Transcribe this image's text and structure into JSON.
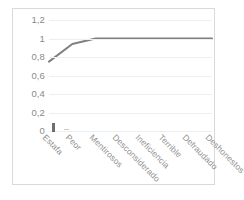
{
  "chart_data": {
    "type": "line",
    "title": "",
    "subtitle": "",
    "xlabel": "",
    "ylabel": "",
    "categories": [
      "Estafa",
      "Peor",
      "Mentirosos",
      "Desconsiderado",
      "Ineficiencia",
      "Terrible",
      "Defraudado",
      "Deshonestos"
    ],
    "values": [
      0.75,
      0.94,
      1,
      1,
      1,
      1,
      1,
      1
    ],
    "series": [
      {
        "name": "",
        "values": [
          0.75,
          0.94,
          1,
          1,
          1,
          1,
          1,
          1
        ],
        "color": "#808080"
      }
    ],
    "ylim": [
      0,
      1.2
    ],
    "ytick_labels": [
      "1,2",
      "1",
      "0,8",
      "0,6",
      "0,4",
      "0,2",
      "0"
    ],
    "ytick_values": [
      1.2,
      1,
      0.8,
      0.6,
      0.4,
      0.2,
      0
    ],
    "grid": true,
    "grid_color": "#eceff1",
    "legend": "none",
    "legend_position": "",
    "line_color": "#808080",
    "border_color": "#d9d9d9",
    "axis_label_color": "#8a8a8a",
    "plot_background": "#ffffff"
  }
}
